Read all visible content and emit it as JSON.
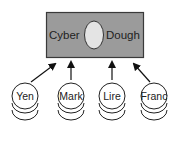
{
  "diagram": {
    "title": "",
    "central_box": {
      "left_label": "Cyber",
      "right_label": "Dough",
      "fill": "#9b9b9b",
      "ellipse_fill": "#e4e4e4"
    },
    "currencies": [
      {
        "label": "Yen"
      },
      {
        "label": "Mark"
      },
      {
        "label": "Lire"
      },
      {
        "label": "Franc"
      }
    ],
    "edges": [
      {
        "from": "Yen",
        "to": "Cyber Dough"
      },
      {
        "from": "Mark",
        "to": "Cyber Dough"
      },
      {
        "from": "Lire",
        "to": "Cyber Dough"
      },
      {
        "from": "Franc",
        "to": "Cyber Dough"
      }
    ]
  }
}
